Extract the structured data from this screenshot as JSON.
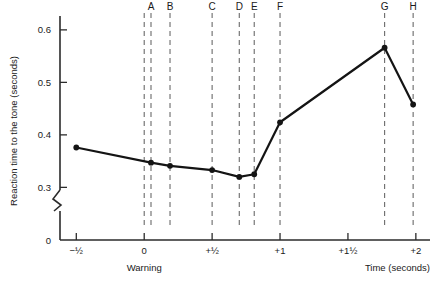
{
  "chart_data": {
    "type": "line",
    "title": "",
    "xlabel": "Time (seconds)",
    "ylabel": "Reaction time to the tone (seconds)",
    "warning_label": "Warning",
    "xlim": [
      -0.62,
      2.06
    ],
    "ylim": [
      0.295,
      0.615
    ],
    "grid": false,
    "legend": "none",
    "y_axis_break": true,
    "y_break_low": 0,
    "y_tick_labels": [
      "0",
      "0.3",
      "0.4",
      "0.5",
      "0.6"
    ],
    "y_tick_values": [
      0,
      0.3,
      0.4,
      0.5,
      0.6
    ],
    "x_tick_labels": [
      "−½",
      "0",
      "+½",
      "+1",
      "+1½",
      "+2"
    ],
    "x_tick_values": [
      -0.5,
      0,
      0.5,
      1.0,
      1.5,
      2.0
    ],
    "series": [
      {
        "name": "Reaction time",
        "x": [
          -0.5,
          0.05,
          0.19,
          0.5,
          0.7,
          0.81,
          1.0,
          1.77,
          1.98
        ],
        "values": [
          0.376,
          0.347,
          0.341,
          0.333,
          0.32,
          0.325,
          0.424,
          0.566,
          0.458
        ]
      }
    ],
    "event_markers": [
      {
        "label": "A",
        "x": 0.05
      },
      {
        "label": "B",
        "x": 0.19
      },
      {
        "label": "C",
        "x": 0.5
      },
      {
        "label": "D",
        "x": 0.7
      },
      {
        "label": "E",
        "x": 0.81
      },
      {
        "label": "F",
        "x": 1.0
      },
      {
        "label": "G",
        "x": 1.77
      },
      {
        "label": "H",
        "x": 1.98
      }
    ],
    "warning_marker_x": 0,
    "colors": {
      "line": "#141414",
      "axis": "#2b2b2b",
      "marker_line": "#6a6a6a",
      "background": "#ffffff"
    }
  }
}
